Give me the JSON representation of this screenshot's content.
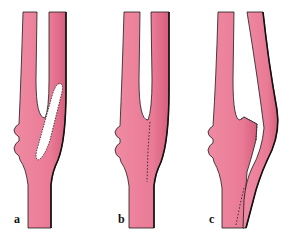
{
  "figure": {
    "vessel_color": "#ea7a95",
    "vessel_shade": "#c8506e",
    "outline_color": "#1a1a1a",
    "background": "#ffffff",
    "panels": [
      {
        "label": "a",
        "content": "Bifurcation with elongated open incision (arteriotomy) lined with sutures in the bulb/crotch region"
      },
      {
        "label": "b",
        "content": "Bifurcation with incision closed by a vertical line of sutures"
      },
      {
        "label": "c",
        "content": "Reconstruction with one branch re-anastomosed to the stem; suture lines at branch stump and lower junction"
      }
    ]
  }
}
